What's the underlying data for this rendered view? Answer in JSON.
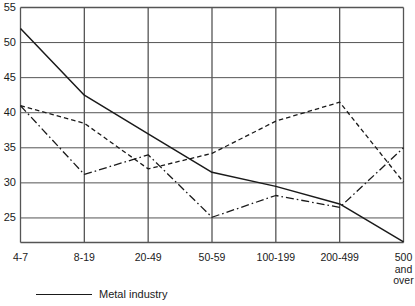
{
  "chart_data": {
    "type": "line",
    "title": "",
    "subtitle": "",
    "xlabel": "",
    "ylabel": "",
    "categories": [
      "4-7",
      "8-19",
      "20-49",
      "50-59",
      "100-199",
      "200-499",
      "500 and over"
    ],
    "x_tick_labels": [
      "4-7",
      "8-19",
      "20-49",
      "50-59",
      "100-199",
      "200-499",
      "500\nand\nover"
    ],
    "y_tick_labels": [
      "55",
      "50",
      "45",
      "40",
      "35",
      "30",
      "25"
    ],
    "y_ticks": [
      55,
      50,
      45,
      40,
      35,
      30,
      25
    ],
    "ylim": [
      21.5,
      55
    ],
    "grid": true,
    "grid_color": "#555555",
    "legend_position": "below-left",
    "series": [
      {
        "name": "Metal industry",
        "style": "solid",
        "color": "#1a1a1a",
        "values": [
          52.0,
          42.5,
          37.0,
          31.5,
          29.5,
          27.0,
          21.6
        ]
      },
      {
        "name": "",
        "style": "dashed",
        "color": "#1a1a1a",
        "values": [
          41.0,
          38.5,
          32.0,
          34.2,
          38.8,
          41.5,
          30.1
        ]
      },
      {
        "name": "",
        "style": "dash-dot",
        "color": "#1a1a1a",
        "values": [
          41.0,
          31.2,
          34.0,
          25.1,
          28.2,
          26.5,
          35.0
        ]
      }
    ]
  },
  "legend": {
    "entries": [
      {
        "label": "Metal industry",
        "style": "solid"
      }
    ]
  }
}
